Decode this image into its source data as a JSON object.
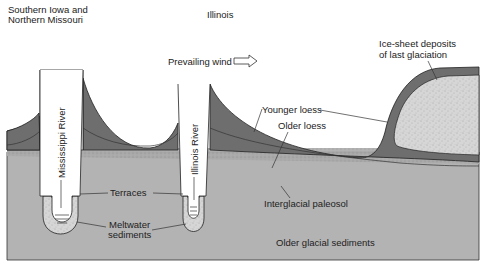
{
  "regions": {
    "left": {
      "line1": "Southern Iowa and",
      "line2": "Northern Missouri"
    },
    "center": "Illinois"
  },
  "wind": {
    "label": "Prevailing wind",
    "icon": "arrow-right-outline-icon"
  },
  "rivers": {
    "mississippi": "Mississippi River",
    "illinois": "Illinois River"
  },
  "labels": {
    "ice_sheet_line1": "Ice-sheet deposits",
    "ice_sheet_line2": "of last glaciation",
    "younger_loess": "Younger loess",
    "older_loess": "Older loess",
    "terraces": "Terraces",
    "meltwater_line1": "Meltwater",
    "meltwater_line2": "sediments",
    "paleosol": "Interglacial paleosol",
    "older_glacial": "Older glacial sediments"
  },
  "colors": {
    "background": "#ffffff",
    "loess": "#6e6e6e",
    "glacial_sediments": "#b3b3b3",
    "ice_deposits": "#d9d9d9",
    "meltwater": "#dcdcdc",
    "paleosol": "#a5a5a5",
    "outline": "#222222"
  }
}
